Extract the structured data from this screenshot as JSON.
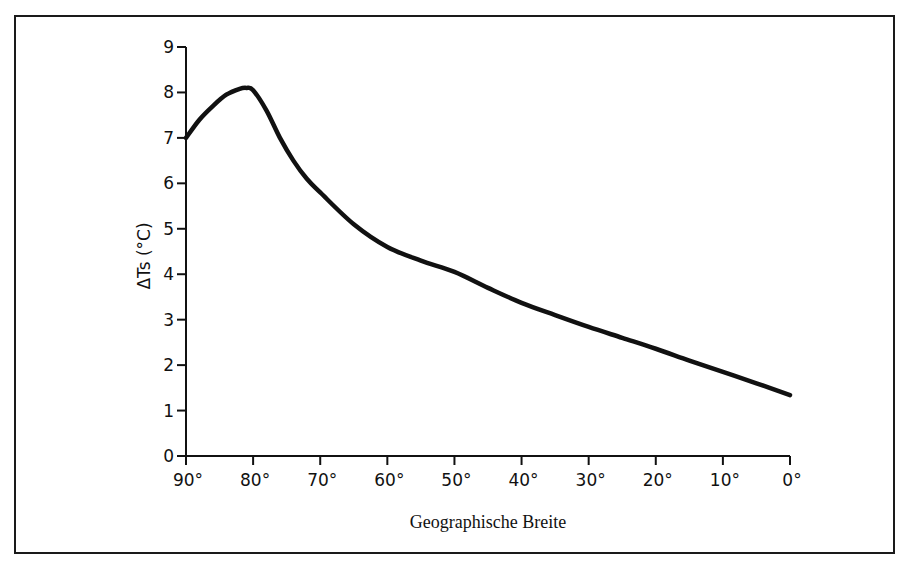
{
  "chart_data": {
    "type": "line",
    "title": "",
    "xlabel": "Geographische Breite",
    "ylabel": "ΔTs (°C)",
    "x_ticks": [
      "90°",
      "80°",
      "70°",
      "60°",
      "50°",
      "40°",
      "30°",
      "20°",
      "10°",
      "0°"
    ],
    "y_ticks": [
      "0",
      "1",
      "2",
      "3",
      "4",
      "5",
      "6",
      "7",
      "8",
      "9"
    ],
    "xlim": [
      90,
      0
    ],
    "ylim": [
      0,
      9
    ],
    "grid": false,
    "legend": null,
    "series": [
      {
        "name": "ΔTs",
        "color": "#111111",
        "x": [
          90,
          88,
          86,
          84,
          82,
          81,
          80,
          78,
          76,
          74,
          72,
          70,
          65,
          60,
          55,
          50,
          45,
          40,
          35,
          30,
          25,
          20,
          15,
          10,
          5,
          0
        ],
        "values": [
          7.0,
          7.4,
          7.7,
          7.95,
          8.08,
          8.1,
          8.05,
          7.6,
          7.0,
          6.5,
          6.1,
          5.8,
          5.1,
          4.6,
          4.3,
          4.05,
          3.7,
          3.37,
          3.1,
          2.84,
          2.6,
          2.36,
          2.1,
          1.85,
          1.6,
          1.34
        ]
      }
    ]
  }
}
